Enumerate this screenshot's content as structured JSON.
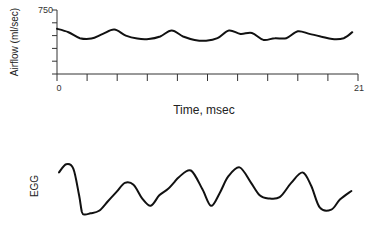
{
  "chart_data": [
    {
      "type": "line",
      "title": "",
      "xlabel": "Time, msec",
      "ylabel": "Airflow (ml/sec)",
      "xlim": [
        0,
        21
      ],
      "ylim": [
        0,
        750
      ],
      "x_tick_labels": [
        "0",
        "21"
      ],
      "x_tick_count": 11,
      "y_tick_labels": [
        "750"
      ],
      "y_tick_values": [
        0,
        150,
        300,
        450,
        600,
        750
      ],
      "grid": false,
      "series": [
        {
          "name": "Airflow",
          "x": [
            0,
            0.8,
            1.6,
            2.4,
            3.2,
            4.0,
            4.8,
            5.6,
            6.4,
            7.2,
            8.0,
            8.8,
            9.6,
            10.4,
            11.2,
            12.0,
            12.8,
            13.6,
            14.4,
            15.2,
            16.0,
            16.8,
            17.6,
            18.4,
            19.2,
            20.0,
            20.6
          ],
          "y": [
            530,
            490,
            420,
            415,
            470,
            520,
            450,
            415,
            410,
            440,
            510,
            440,
            400,
            390,
            420,
            510,
            470,
            480,
            400,
            420,
            420,
            500,
            470,
            440,
            410,
            420,
            490
          ]
        }
      ]
    },
    {
      "type": "line",
      "title": "",
      "xlabel": "",
      "ylabel": "EGG",
      "xlim": [
        0,
        21
      ],
      "ylim": [
        0,
        1
      ],
      "grid": false,
      "series": [
        {
          "name": "EGG",
          "x": [
            0,
            0.5,
            1.0,
            1.4,
            1.6,
            1.8,
            2.2,
            2.8,
            3.4,
            4.0,
            4.6,
            5.2,
            5.8,
            6.4,
            7.0,
            7.6,
            8.0,
            8.4,
            9.2,
            10.0,
            10.6,
            11.2,
            11.8,
            12.6,
            13.4,
            14.0,
            14.6,
            15.4,
            16.2,
            17.0,
            17.6,
            18.2,
            19.0,
            19.6,
            20.4
          ],
          "y": [
            0.72,
            0.85,
            0.78,
            0.35,
            0.08,
            0.04,
            0.06,
            0.1,
            0.25,
            0.4,
            0.55,
            0.52,
            0.3,
            0.18,
            0.35,
            0.45,
            0.55,
            0.65,
            0.75,
            0.45,
            0.18,
            0.38,
            0.65,
            0.8,
            0.55,
            0.35,
            0.3,
            0.32,
            0.55,
            0.72,
            0.5,
            0.15,
            0.12,
            0.28,
            0.42
          ]
        }
      ]
    }
  ]
}
